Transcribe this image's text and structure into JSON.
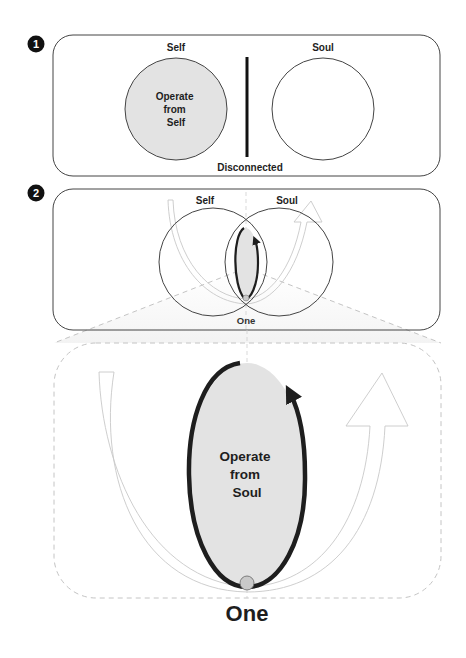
{
  "colors": {
    "ink": "#1e1e1e",
    "outline": "#444444",
    "fill_gray": "#e3e3e3",
    "ghost": "#c8c8c8",
    "dash": "#bdbdbd",
    "dot": "#c9c9c9"
  },
  "panel1": {
    "badge": "1",
    "left_label": "Self",
    "right_label": "Soul",
    "inner_text": [
      "Operate",
      "from",
      "Self"
    ],
    "divider_label": "Disconnected"
  },
  "panel2": {
    "badge": "2",
    "left_label": "Self",
    "right_label": "Soul",
    "bottom_label": "One"
  },
  "enlargement": {
    "inner_text": [
      "Operate",
      "from",
      "Soul"
    ],
    "bottom_label": "One"
  }
}
